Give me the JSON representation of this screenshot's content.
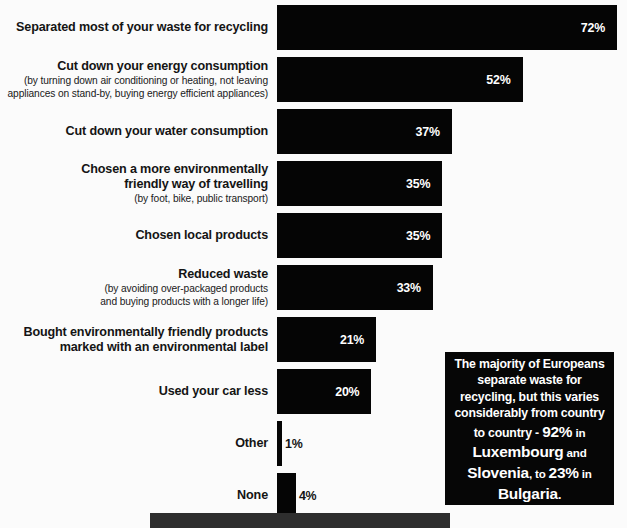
{
  "chart_data": {
    "type": "bar",
    "orientation": "horizontal",
    "title": "",
    "xlabel": "",
    "ylabel": "",
    "value_suffix": "%",
    "xlim": [
      0,
      72
    ],
    "grid": false,
    "legend": false,
    "bar_color": "#050505",
    "background_color": "#fbfbfb",
    "categories": [
      "Separated most of your waste for recycling",
      "Cut down your energy consumption",
      "Cut down your water consumption",
      "Chosen a more environmentally friendly way of travelling",
      "Chosen local products",
      "Reduced waste",
      "Bought environmentally friendly products marked with an environmental label",
      "Used your car less",
      "Other",
      "None"
    ],
    "values": [
      72,
      52,
      37,
      35,
      35,
      33,
      21,
      20,
      1,
      4
    ],
    "value_labels": [
      "72%",
      "52%",
      "37%",
      "35%",
      "35%",
      "33%",
      "21%",
      "20%",
      "1%",
      "4%"
    ]
  },
  "rows": [
    {
      "label_lines": [
        "Separated most of your waste for recycling"
      ],
      "sublabel_lines": [],
      "value": 72,
      "value_label": "72%"
    },
    {
      "label_lines": [
        "Cut down your energy consumption"
      ],
      "sublabel_lines": [
        "(by turning down air conditioning or heating, not leaving",
        "appliances on stand-by, buying energy efficient appliances)"
      ],
      "value": 52,
      "value_label": "52%"
    },
    {
      "label_lines": [
        "Cut down your water consumption"
      ],
      "sublabel_lines": [],
      "value": 37,
      "value_label": "37%"
    },
    {
      "label_lines": [
        "Chosen a more environmentally",
        "friendly way of travelling"
      ],
      "sublabel_lines": [
        "(by foot, bike, public transport)"
      ],
      "value": 35,
      "value_label": "35%"
    },
    {
      "label_lines": [
        "Chosen local products"
      ],
      "sublabel_lines": [],
      "value": 35,
      "value_label": "35%"
    },
    {
      "label_lines": [
        "Reduced waste"
      ],
      "sublabel_lines": [
        "(by avoiding over-packaged products",
        "and buying products with a longer life)"
      ],
      "value": 33,
      "value_label": "33%"
    },
    {
      "label_lines": [
        "Bought environmentally friendly products",
        "marked with an environmental label"
      ],
      "sublabel_lines": [],
      "value": 21,
      "value_label": "21%"
    },
    {
      "label_lines": [
        "Used your car less"
      ],
      "sublabel_lines": [],
      "value": 20,
      "value_label": "20%"
    },
    {
      "label_lines": [
        "Other"
      ],
      "sublabel_lines": [],
      "value": 1,
      "value_label": "1%"
    },
    {
      "label_lines": [
        "None"
      ],
      "sublabel_lines": [],
      "value": 4,
      "value_label": "4%"
    }
  ],
  "callout": {
    "segments": [
      {
        "text": "The majority of Europeans separate waste for recycling, but this varies considerably from country to country - ",
        "style": "normal"
      },
      {
        "text": "92%",
        "style": "big"
      },
      {
        "text": " in ",
        "style": "lite"
      },
      {
        "text": "Luxembourg",
        "style": "big"
      },
      {
        "text": " and ",
        "style": "lite"
      },
      {
        "text": "Slovenia",
        "style": "big"
      },
      {
        "text": ", to ",
        "style": "lite"
      },
      {
        "text": "23%",
        "style": "big"
      },
      {
        "text": " in ",
        "style": "lite"
      },
      {
        "text": "Bulgaria",
        "style": "big"
      },
      {
        "text": ".",
        "style": "normal"
      }
    ],
    "plain_text": "The majority of Europeans separate waste for recycling, but this varies considerably from country to country - 92% in Luxembourg and Slovenia, to 23% in Bulgaria.",
    "background_color": "#060606",
    "text_color": "#ffffff"
  },
  "bottom_strip": {
    "color": "#2e2e2e"
  }
}
